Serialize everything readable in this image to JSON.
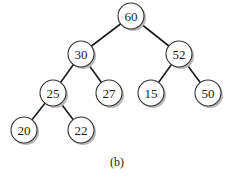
{
  "diagram": {
    "type": "binary-tree",
    "caption": "(b)",
    "nodes": [
      {
        "id": "n60",
        "label": "60",
        "x": 131,
        "y": 16
      },
      {
        "id": "n30",
        "label": "30",
        "x": 81,
        "y": 54
      },
      {
        "id": "n52",
        "label": "52",
        "x": 179,
        "y": 54
      },
      {
        "id": "n25",
        "label": "25",
        "x": 53,
        "y": 93
      },
      {
        "id": "n27",
        "label": "27",
        "x": 109,
        "y": 93
      },
      {
        "id": "n15",
        "label": "15",
        "x": 151,
        "y": 93
      },
      {
        "id": "n50",
        "label": "50",
        "x": 208,
        "y": 93
      },
      {
        "id": "n20",
        "label": "20",
        "x": 24,
        "y": 130
      },
      {
        "id": "n22",
        "label": "22",
        "x": 81,
        "y": 130
      }
    ],
    "edges": [
      {
        "from": "n60",
        "to": "n30"
      },
      {
        "from": "n60",
        "to": "n52"
      },
      {
        "from": "n30",
        "to": "n25"
      },
      {
        "from": "n30",
        "to": "n27"
      },
      {
        "from": "n52",
        "to": "n15"
      },
      {
        "from": "n52",
        "to": "n50"
      },
      {
        "from": "n25",
        "to": "n20"
      },
      {
        "from": "n25",
        "to": "n22"
      }
    ]
  }
}
